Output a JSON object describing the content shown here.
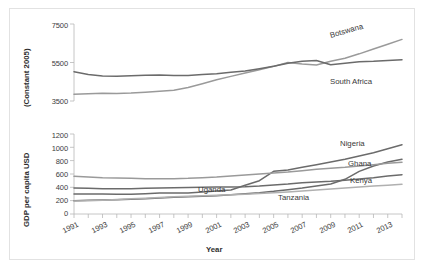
{
  "figure": {
    "border_color": "#e2e2e2",
    "background": "#ffffff"
  },
  "chart_data": [
    {
      "type": "line",
      "panel": "top",
      "title": "",
      "xlabel": "",
      "ylabel": "(Constant 2005)",
      "ylim": [
        3500,
        7500
      ],
      "yticks": [
        3500,
        5500,
        7500
      ],
      "xlim": [
        1991,
        2014
      ],
      "x": [
        1991,
        1992,
        1993,
        1994,
        1995,
        1996,
        1997,
        1998,
        1999,
        2000,
        2001,
        2002,
        2003,
        2004,
        2005,
        2006,
        2007,
        2008,
        2009,
        2010,
        2011,
        2012,
        2013,
        2014
      ],
      "grid": false,
      "legend": "inline-right",
      "series": [
        {
          "name": "Botswana",
          "color": "#9a9a9a",
          "values": [
            3850,
            3880,
            3900,
            3890,
            3910,
            3960,
            4010,
            4060,
            4200,
            4400,
            4600,
            4780,
            4950,
            5120,
            5300,
            5500,
            5420,
            5370,
            5560,
            5720,
            5950,
            6200,
            6450,
            6700
          ]
        },
        {
          "name": "South Africa",
          "color": "#6b6b6b",
          "values": [
            5020,
            4880,
            4800,
            4790,
            4810,
            4840,
            4850,
            4820,
            4830,
            4880,
            4920,
            4990,
            5060,
            5180,
            5300,
            5460,
            5570,
            5600,
            5380,
            5460,
            5540,
            5560,
            5600,
            5640
          ]
        }
      ]
    },
    {
      "type": "line",
      "panel": "bottom",
      "title": "",
      "xlabel": "Year",
      "ylabel": "GDP per capita USD",
      "ylim": [
        0,
        1200
      ],
      "yticks": [
        0,
        200,
        400,
        600,
        800,
        1000,
        1200
      ],
      "xlim": [
        1991,
        2014
      ],
      "x": [
        1991,
        1992,
        1993,
        1994,
        1995,
        1996,
        1997,
        1998,
        1999,
        2000,
        2001,
        2002,
        2003,
        2004,
        2005,
        2006,
        2007,
        2008,
        2009,
        2010,
        2011,
        2012,
        2013,
        2014
      ],
      "grid": false,
      "legend": "inline-right",
      "series": [
        {
          "name": "Nigeria",
          "color": "#6b6b6b",
          "values": [
            300,
            300,
            300,
            295,
            295,
            305,
            315,
            315,
            315,
            330,
            345,
            360,
            430,
            500,
            640,
            660,
            700,
            740,
            780,
            820,
            870,
            920,
            980,
            1040
          ]
        },
        {
          "name": "Ghana",
          "color": "#6b6b6b",
          "values": [
            200,
            205,
            210,
            215,
            220,
            230,
            240,
            250,
            260,
            265,
            275,
            290,
            305,
            320,
            340,
            365,
            390,
            420,
            450,
            520,
            640,
            720,
            780,
            820
          ]
        },
        {
          "name": "Kenya",
          "color": "#6b6b6b",
          "values": [
            390,
            385,
            380,
            378,
            380,
            385,
            390,
            395,
            398,
            400,
            405,
            405,
            410,
            420,
            435,
            450,
            470,
            480,
            490,
            505,
            525,
            545,
            570,
            590
          ]
        },
        {
          "name": "Tanzania",
          "color": "#9a9a9a",
          "values": [
            565,
            555,
            545,
            540,
            535,
            530,
            528,
            530,
            535,
            545,
            555,
            570,
            585,
            600,
            615,
            630,
            650,
            670,
            685,
            700,
            720,
            740,
            760,
            775
          ]
        },
        {
          "name": "Uganda",
          "color": "#b0b0b0",
          "values": [
            195,
            200,
            208,
            218,
            228,
            238,
            248,
            258,
            265,
            272,
            280,
            288,
            296,
            306,
            318,
            330,
            345,
            360,
            375,
            390,
            405,
            420,
            432,
            445
          ]
        }
      ]
    }
  ],
  "top_chart": {
    "ytitle": "(Constant 2005)",
    "yticks": [
      "7500",
      "5500",
      "3500"
    ],
    "labels": [
      {
        "name": "Botswana",
        "text": "Botswana"
      },
      {
        "name": "South Africa",
        "text": "South Africa"
      }
    ]
  },
  "bottom_chart": {
    "ytitle": "GDP per capita USD",
    "xtitle": "Year",
    "yticks": [
      "1200",
      "1000",
      "800",
      "600",
      "400",
      "200",
      "0"
    ],
    "xticks": [
      "1991",
      "1993",
      "1995",
      "1997",
      "1999",
      "2001",
      "2003",
      "2005",
      "2007",
      "2009",
      "2011",
      "2013"
    ],
    "labels": [
      {
        "name": "Nigeria",
        "text": "Nigeria"
      },
      {
        "name": "Ghana",
        "text": "Ghana"
      },
      {
        "name": "Kenya",
        "text": "Kenya"
      },
      {
        "name": "Tanzania",
        "text": "Tanzania"
      },
      {
        "name": "Uganda",
        "text": "Uganda"
      }
    ]
  }
}
